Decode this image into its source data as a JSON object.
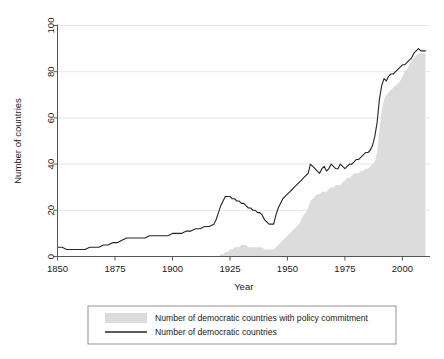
{
  "chart_data": {
    "type": "area",
    "title": "",
    "xlabel": "Year",
    "ylabel": "Number of countries",
    "xlim": [
      1850,
      2012
    ],
    "ylim": [
      0,
      100
    ],
    "grid": "horizontal",
    "legend_position": "below-outside",
    "xticks": [
      1850,
      1875,
      1900,
      1925,
      1950,
      1975,
      2000
    ],
    "xtick_labels": [
      "1850",
      "1875",
      "1900",
      "1925",
      "1950",
      "1975",
      "2000"
    ],
    "yticks": [
      0,
      20,
      40,
      60,
      80,
      100
    ],
    "ytick_labels": [
      "0",
      "20",
      "40",
      "60",
      "80",
      "100"
    ],
    "series": [
      {
        "name": "Number of democratic countries with policy commitment",
        "render": "area",
        "color": "#dcdcdc",
        "x": [
          1850,
          1860,
          1870,
          1880,
          1890,
          1900,
          1910,
          1915,
          1918,
          1920,
          1921,
          1922,
          1923,
          1924,
          1925,
          1926,
          1927,
          1928,
          1929,
          1930,
          1931,
          1932,
          1933,
          1934,
          1935,
          1936,
          1937,
          1938,
          1939,
          1940,
          1941,
          1942,
          1943,
          1944,
          1945,
          1946,
          1947,
          1948,
          1949,
          1950,
          1951,
          1952,
          1953,
          1954,
          1955,
          1956,
          1957,
          1958,
          1959,
          1960,
          1961,
          1962,
          1963,
          1964,
          1965,
          1966,
          1967,
          1968,
          1969,
          1970,
          1971,
          1972,
          1973,
          1974,
          1975,
          1976,
          1977,
          1978,
          1979,
          1980,
          1981,
          1982,
          1983,
          1984,
          1985,
          1986,
          1987,
          1988,
          1989,
          1990,
          1991,
          1992,
          1993,
          1994,
          1995,
          1996,
          1997,
          1998,
          1999,
          2000,
          2001,
          2002,
          2003,
          2004,
          2005,
          2006,
          2007,
          2008,
          2009,
          2010
        ],
        "values": [
          0,
          0,
          0,
          0,
          0,
          0,
          0,
          0,
          0,
          0,
          1,
          1,
          2,
          2,
          3,
          3,
          4,
          4,
          4,
          5,
          5,
          5,
          4,
          4,
          4,
          4,
          4,
          4,
          4,
          3,
          3,
          3,
          3,
          3,
          4,
          5,
          6,
          7,
          8,
          9,
          10,
          11,
          12,
          13,
          14,
          16,
          18,
          19,
          21,
          24,
          25,
          26,
          27,
          27,
          28,
          28,
          28,
          29,
          30,
          30,
          31,
          31,
          31,
          32,
          33,
          34,
          34,
          35,
          36,
          36,
          36,
          37,
          37,
          38,
          38,
          39,
          40,
          41,
          45,
          55,
          63,
          68,
          70,
          71,
          72,
          73,
          74,
          75,
          76,
          78,
          80,
          81,
          83,
          85,
          86,
          87,
          88,
          88,
          88,
          88
        ]
      },
      {
        "name": "Number of democratic countries",
        "render": "line",
        "color": "#242424",
        "x": [
          1850,
          1852,
          1854,
          1856,
          1858,
          1860,
          1862,
          1864,
          1866,
          1868,
          1870,
          1872,
          1874,
          1876,
          1878,
          1880,
          1882,
          1884,
          1886,
          1888,
          1890,
          1892,
          1894,
          1896,
          1898,
          1900,
          1902,
          1904,
          1906,
          1908,
          1910,
          1912,
          1914,
          1916,
          1918,
          1919,
          1920,
          1921,
          1922,
          1923,
          1924,
          1925,
          1926,
          1927,
          1928,
          1929,
          1930,
          1931,
          1932,
          1933,
          1934,
          1935,
          1936,
          1937,
          1938,
          1939,
          1940,
          1941,
          1942,
          1943,
          1944,
          1945,
          1946,
          1947,
          1948,
          1949,
          1950,
          1951,
          1952,
          1953,
          1954,
          1955,
          1956,
          1957,
          1958,
          1959,
          1960,
          1961,
          1962,
          1963,
          1964,
          1965,
          1966,
          1967,
          1968,
          1969,
          1970,
          1971,
          1972,
          1973,
          1974,
          1975,
          1976,
          1977,
          1978,
          1979,
          1980,
          1981,
          1982,
          1983,
          1984,
          1985,
          1986,
          1987,
          1988,
          1989,
          1990,
          1991,
          1992,
          1993,
          1994,
          1995,
          1996,
          1997,
          1998,
          1999,
          2000,
          2001,
          2002,
          2003,
          2004,
          2005,
          2006,
          2007,
          2008,
          2009,
          2010
        ],
        "values": [
          4,
          4,
          3,
          3,
          3,
          3,
          3,
          4,
          4,
          4,
          5,
          5,
          6,
          6,
          7,
          8,
          8,
          8,
          8,
          8,
          9,
          9,
          9,
          9,
          9,
          10,
          10,
          10,
          11,
          11,
          12,
          12,
          13,
          13,
          14,
          16,
          19,
          22,
          24,
          26,
          26,
          26,
          25,
          25,
          24,
          24,
          23,
          23,
          22,
          21,
          21,
          20,
          20,
          19,
          19,
          18,
          16,
          15,
          14,
          14,
          14,
          18,
          21,
          23,
          25,
          26,
          27,
          28,
          29,
          30,
          31,
          32,
          33,
          34,
          35,
          36,
          40,
          39,
          38,
          37,
          36,
          38,
          39,
          37,
          38,
          40,
          39,
          38,
          38,
          40,
          39,
          38,
          39,
          40,
          40,
          41,
          42,
          42,
          43,
          44,
          45,
          45,
          46,
          48,
          52,
          58,
          68,
          74,
          77,
          76,
          78,
          79,
          79,
          80,
          81,
          82,
          83,
          83,
          84,
          85,
          86,
          88,
          89,
          90,
          89,
          89,
          89
        ]
      }
    ]
  },
  "legend": {
    "items": [
      {
        "label": "Number of democratic countries with policy commitment",
        "swatch": "area-swatch"
      },
      {
        "label": "Number of democratic countries",
        "swatch": "line-swatch"
      }
    ]
  },
  "colors": {
    "area_fill": "#dcdcdc",
    "line": "#242424",
    "gridline": "#e8e8e8",
    "axis": "#555555",
    "background": "#ffffff"
  }
}
